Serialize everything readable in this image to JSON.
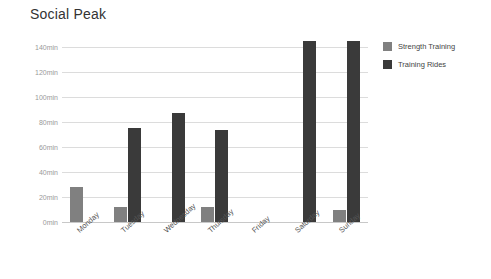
{
  "chart_data": {
    "type": "bar",
    "title": "Social Peak",
    "xlabel": "",
    "ylabel": "",
    "ylim": [
      0,
      140
    ],
    "grid": true,
    "legend_position": "right",
    "categories": [
      "Monday",
      "Tuesday",
      "Wednesday",
      "Thursday",
      "Friday",
      "Saturday",
      "Sunday"
    ],
    "ytick_labels": [
      "0min",
      "20min",
      "40min",
      "60min",
      "80min",
      "100min",
      "120min",
      "140min"
    ],
    "ytick_values": [
      0,
      20,
      40,
      60,
      80,
      100,
      120,
      140
    ],
    "series": [
      {
        "name": "Strength Training",
        "color": "#808080",
        "values": [
          28,
          12,
          0,
          12,
          0,
          0,
          10
        ]
      },
      {
        "name": "Training Rides",
        "color": "#3a3a3a",
        "values": [
          0,
          75,
          87,
          74,
          0,
          145,
          145
        ]
      }
    ]
  },
  "colors": {
    "background": "#ffffff",
    "gridline": "#dcdcdc",
    "baseline": "#c8c8c8",
    "title_text": "#333333",
    "axis_text": "#9a9a9a",
    "category_text": "#555555",
    "strength_training": "#808080",
    "training_rides": "#3a3a3a"
  }
}
